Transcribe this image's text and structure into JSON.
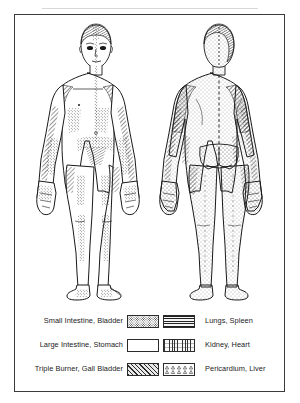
{
  "figure": {
    "title_visible": false,
    "frame_border_color": "#3a3a3a",
    "background_color": "#ffffff"
  },
  "bodies": {
    "anterior": {
      "name": "anterior-body-figure",
      "view": "front",
      "description": "Front view of human body with stippled and hatched meridian zone markings"
    },
    "posterior": {
      "name": "posterior-body-figure",
      "view": "back",
      "description": "Back view of human body with stippled and hatched meridian zone markings"
    }
  },
  "legend": {
    "left_column": [
      {
        "label": "Small Intestine, Bladder",
        "pattern": "stipple",
        "swatch_name": "swatch-stipple"
      },
      {
        "label": "Large Intestine, Stomach",
        "pattern": "blank",
        "swatch_name": "swatch-blank"
      },
      {
        "label": "Triple Burner, Gall Bladder",
        "pattern": "diagonal-hatch",
        "swatch_name": "swatch-diagonal"
      }
    ],
    "right_column": [
      {
        "label": "Lungs, Spleen",
        "pattern": "horizontal-lines",
        "swatch_name": "swatch-horizontal"
      },
      {
        "label": "Kidney, Heart",
        "pattern": "vertical-dashes",
        "swatch_name": "swatch-vertical"
      },
      {
        "label": "Pericardium, Liver",
        "pattern": "triangles",
        "swatch_name": "swatch-triangles"
      }
    ]
  },
  "colors": {
    "ink": "#1a1a1a",
    "frame": "#3a3a3a",
    "rule": "#d8d8d8",
    "paper": "#ffffff"
  }
}
